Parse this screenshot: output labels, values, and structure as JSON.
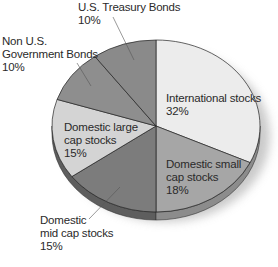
{
  "chart_data": {
    "type": "pie",
    "title": "",
    "style": "3d-tilted",
    "slices": [
      {
        "label": "International stocks",
        "value": 32,
        "color": "#ececec"
      },
      {
        "label": "Domestic small cap stocks",
        "value": 18,
        "color": "#a6a6a6"
      },
      {
        "label": "Domestic mid cap stocks",
        "value": 15,
        "color": "#7c7c7c"
      },
      {
        "label": "Domestic large cap stocks",
        "value": 15,
        "color": "#d4d4d4"
      },
      {
        "label": "Non U.S. Government Bonds",
        "value": 10,
        "color": "#8e8e8e"
      },
      {
        "label": "U.S. Treasury Bonds",
        "value": 10,
        "color": "#8a8a8a"
      }
    ]
  },
  "labels": {
    "international": {
      "line1": "International stocks",
      "line2": "32%"
    },
    "small_cap": {
      "line1": "Domestic small",
      "line2": "cap stocks",
      "line3": "18%"
    },
    "mid_cap": {
      "line1": "Domestic",
      "line2": "mid cap stocks",
      "line3": "15%"
    },
    "large_cap": {
      "line1": "Domestic large",
      "line2": "cap stocks",
      "line3": "15%"
    },
    "non_us": {
      "line1": "Non U.S.",
      "line2": "Government Bonds",
      "line3": "10%"
    },
    "treasury": {
      "line1": "U.S. Treasury Bonds",
      "line2": "10%"
    }
  }
}
